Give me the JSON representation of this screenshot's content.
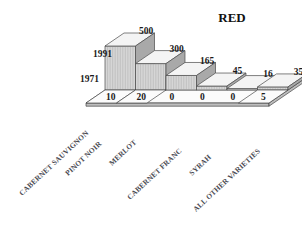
{
  "chart": {
    "title": "RED",
    "type": "bar"
  },
  "chart_data": {
    "type": "bar",
    "title": "RED",
    "subtitle": "",
    "xlabel": "",
    "ylabel": "",
    "grid": false,
    "legend_position": "left-inline",
    "three_d": true,
    "categories": [
      "CABERNET SAUVIGNON",
      "PINOT NOIR",
      "MERLOT",
      "CABERNET FRANC",
      "SYRAH",
      "ALL OTHER VARIETIES"
    ],
    "series": [
      {
        "name": "1991",
        "values": [
          500,
          300,
          165,
          45,
          16,
          35
        ]
      },
      {
        "name": "1971",
        "values": [
          10,
          20,
          0,
          0,
          0,
          5
        ]
      }
    ],
    "value_labels_1991": [
      "500",
      "300",
      "165",
      "45",
      "16",
      "35"
    ],
    "value_labels_1971": [
      "10",
      "20",
      "0",
      "0",
      "0",
      "5"
    ],
    "ylim": [
      0,
      500
    ]
  }
}
